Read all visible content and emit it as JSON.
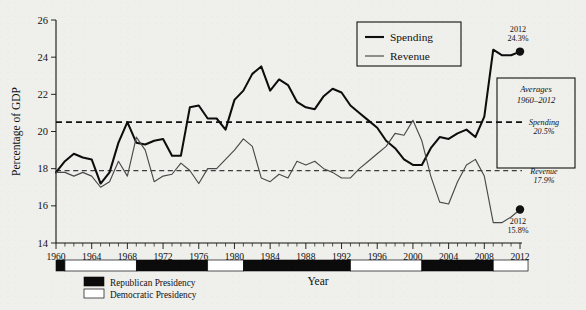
{
  "chart_data": {
    "type": "line",
    "title": "",
    "xlabel": "Year",
    "ylabel": "Percentage of GDP",
    "xlim": [
      1960,
      2012
    ],
    "ylim": [
      14,
      26
    ],
    "ytick_step": 2,
    "yticks": [
      14,
      16,
      18,
      20,
      22,
      24,
      26
    ],
    "xticks": [
      1960,
      1964,
      1968,
      1972,
      1976,
      1980,
      1984,
      1988,
      1992,
      1996,
      2000,
      2004,
      2008,
      2012
    ],
    "x": [
      1960,
      1961,
      1962,
      1963,
      1964,
      1965,
      1966,
      1967,
      1968,
      1969,
      1970,
      1971,
      1972,
      1973,
      1974,
      1975,
      1976,
      1977,
      1978,
      1979,
      1980,
      1981,
      1982,
      1983,
      1984,
      1985,
      1986,
      1987,
      1988,
      1989,
      1990,
      1991,
      1992,
      1993,
      1994,
      1995,
      1996,
      1997,
      1998,
      1999,
      2000,
      2001,
      2002,
      2003,
      2004,
      2005,
      2006,
      2007,
      2008,
      2009,
      2010,
      2011,
      2012
    ],
    "grid": false,
    "legend_position": "top-center-right",
    "series": [
      {
        "name": "Spending",
        "color": "#0d0d0d",
        "values": [
          17.8,
          18.4,
          18.8,
          18.6,
          18.5,
          17.2,
          17.8,
          19.4,
          20.5,
          19.4,
          19.3,
          19.5,
          19.6,
          18.7,
          18.7,
          21.3,
          21.4,
          20.7,
          20.7,
          20.1,
          21.7,
          22.2,
          23.1,
          23.5,
          22.2,
          22.8,
          22.5,
          21.6,
          21.3,
          21.2,
          21.9,
          22.3,
          22.1,
          21.4,
          21.0,
          20.6,
          20.2,
          19.5,
          19.1,
          18.5,
          18.2,
          18.2,
          19.1,
          19.7,
          19.6,
          19.9,
          20.1,
          19.7,
          20.8,
          24.4,
          24.1,
          24.1,
          24.3
        ]
      },
      {
        "name": "Revenue",
        "color": "#4a4a4a",
        "values": [
          17.8,
          17.8,
          17.6,
          17.8,
          17.6,
          17.0,
          17.3,
          18.4,
          17.6,
          19.7,
          19.0,
          17.3,
          17.6,
          17.7,
          18.3,
          17.9,
          17.2,
          18.0,
          18.0,
          18.5,
          19.0,
          19.6,
          19.2,
          17.5,
          17.3,
          17.7,
          17.5,
          18.4,
          18.2,
          18.4,
          18.0,
          17.8,
          17.5,
          17.5,
          18.0,
          18.4,
          18.8,
          19.2,
          19.9,
          19.8,
          20.6,
          19.5,
          17.6,
          16.2,
          16.1,
          17.3,
          18.2,
          18.5,
          17.6,
          15.1,
          15.1,
          15.4,
          15.8
        ]
      }
    ],
    "averages": {
      "box_title_line1": "Averages",
      "box_title_line2": "1960–2012",
      "spending_label": "Spending",
      "spending_value": "20.5%",
      "spending_level": 20.5,
      "revenue_label": "Revenue",
      "revenue_value": "17.9%",
      "revenue_level": 17.9
    },
    "endpoint_annotations": [
      {
        "series": "Spending",
        "year_label": "2012",
        "value_label": "24.3%",
        "year": 2012,
        "value": 24.3
      },
      {
        "series": "Revenue",
        "year_label": "2012",
        "value_label": "15.8%",
        "year": 2012,
        "value": 15.8
      }
    ],
    "legend": {
      "entries": [
        {
          "label": "Spending",
          "color": "#0d0d0d",
          "weight": "thick"
        },
        {
          "label": "Revenue",
          "color": "#4a4a4a",
          "weight": "thin"
        }
      ]
    },
    "presidency_bar": {
      "republican_label": "Republican Presidency",
      "democratic_label": "Democratic Presidency",
      "republican_color": "#0b0b0b",
      "democratic_color": "#ffffff",
      "segments": [
        {
          "party": "Republican",
          "start": 1960,
          "end": 1961
        },
        {
          "party": "Democratic",
          "start": 1961,
          "end": 1969
        },
        {
          "party": "Republican",
          "start": 1969,
          "end": 1977
        },
        {
          "party": "Democratic",
          "start": 1977,
          "end": 1981
        },
        {
          "party": "Republican",
          "start": 1981,
          "end": 1993
        },
        {
          "party": "Democratic",
          "start": 1993,
          "end": 2001
        },
        {
          "party": "Republican",
          "start": 2001,
          "end": 2009
        },
        {
          "party": "Democratic",
          "start": 2009,
          "end": 2012.9
        }
      ]
    }
  }
}
